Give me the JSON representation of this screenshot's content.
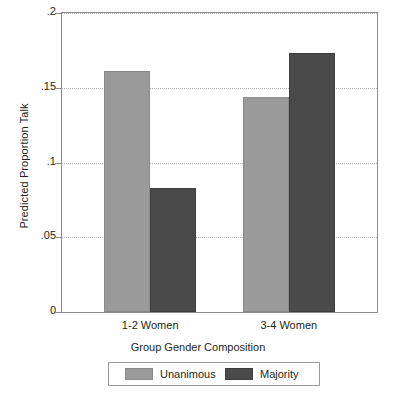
{
  "chart_data": {
    "type": "bar",
    "title": "",
    "xlabel": "Group Gender Composition",
    "ylabel": "Predicted Proportion Talk",
    "categories": [
      "1-2 Women",
      "3-4 Women"
    ],
    "series": [
      {
        "name": "Unanimous",
        "color": "#9a9a9a",
        "values": [
          0.161,
          0.144
        ]
      },
      {
        "name": "Majority",
        "color": "#4a4a4a",
        "values": [
          0.083,
          0.173
        ]
      }
    ],
    "ylim": [
      0,
      0.2
    ],
    "yticks": [
      0,
      0.05,
      0.1,
      0.15,
      0.2
    ],
    "ytick_labels": [
      "0",
      ".05",
      ".1",
      ".15",
      ".2"
    ],
    "grid": "horizontal-dotted",
    "legend_position": "bottom",
    "legend_entries": [
      "Unanimous",
      "Majority"
    ]
  },
  "axis": {
    "y_title": "Predicted Proportion Talk",
    "x_title": "Group Gender Composition",
    "y_tick_0": "0",
    "y_tick_1": ".05",
    "y_tick_2": ".1",
    "y_tick_3": ".15",
    "y_tick_4": ".2",
    "x_cat_0": "1-2 Women",
    "x_cat_1": "3-4 Women"
  },
  "legend": {
    "entry_0_label": "Unanimous",
    "entry_1_label": "Majority"
  }
}
